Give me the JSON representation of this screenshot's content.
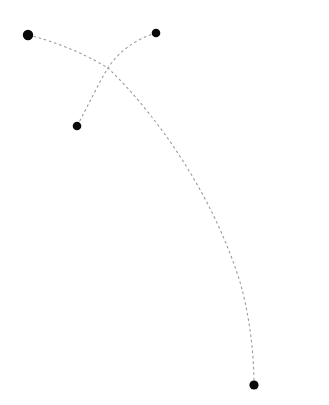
{
  "canvas": {
    "width": 329,
    "height": 405,
    "background_color": "#ffffff",
    "title": "Dashed trajectory diagram"
  },
  "style": {
    "dot_color": "#0a0a0a",
    "curve_color": "#9a9aa2",
    "curve_stroke_width": 1.1,
    "dash_pattern": "2.6 2.8"
  },
  "chart_data": {
    "type": "scatter",
    "title": "",
    "xlabel": "",
    "ylabel": "",
    "grid": false,
    "legend": null,
    "xlim": [
      0,
      329
    ],
    "ylim": [
      0,
      405
    ],
    "points": [
      {
        "id": "p1",
        "label": "top-left-node",
        "x": 28,
        "y": 35,
        "radius": 5.2
      },
      {
        "id": "p2",
        "label": "top-right-node",
        "x": 156,
        "y": 33,
        "radius": 4.3
      },
      {
        "id": "p3",
        "label": "mid-left-node",
        "x": 77,
        "y": 126,
        "radius": 4.3
      },
      {
        "id": "p4",
        "label": "bottom-right-node",
        "x": 254,
        "y": 385,
        "radius": 4.6
      }
    ],
    "curves": [
      {
        "id": "c1",
        "label": "long-descending-arc",
        "from": "p1",
        "to": "p4",
        "style": "dashed",
        "path": "M 28 35 C 74 46 108 68 108 68 C 160 118 214 198 240 282 C 249 313 254 352 254 385"
      },
      {
        "id": "c2",
        "label": "short-rising-arc",
        "from": "p3",
        "to": "p2",
        "style": "dashed",
        "path": "M 77 126 C 89 104 98 84 108 68 C 119 51 136 39 156 33"
      }
    ],
    "intersections": [
      {
        "label": "crossing-point",
        "x": 108,
        "y": 68,
        "curves": [
          "c1",
          "c2"
        ]
      }
    ]
  }
}
